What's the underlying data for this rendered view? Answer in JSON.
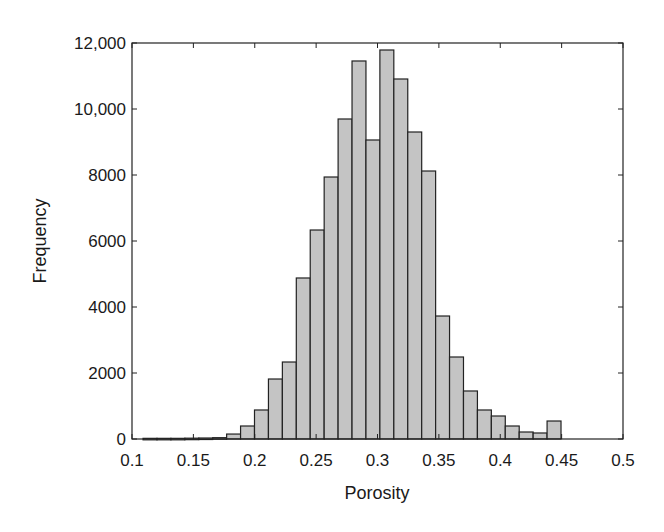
{
  "chart_data": {
    "type": "bar",
    "subtype": "histogram",
    "title": "",
    "xlabel": "Porosity",
    "ylabel": "Frequency",
    "xlim": [
      0.1,
      0.5
    ],
    "ylim": [
      0,
      12000
    ],
    "xticks": [
      0.1,
      0.15,
      0.2,
      0.25,
      0.3,
      0.35,
      0.4,
      0.45,
      0.5
    ],
    "xtick_labels": [
      "0.1",
      "0.15",
      "0.2",
      "0.25",
      "0.3",
      "0.35",
      "0.4",
      "0.45",
      "0.5"
    ],
    "yticks": [
      0,
      2000,
      4000,
      6000,
      8000,
      10000,
      12000
    ],
    "ytick_labels": [
      "0",
      "2000",
      "4000",
      "6000",
      "8000",
      "10,000",
      "12,000"
    ],
    "grid": false,
    "legend": null,
    "bin_start": 0.109,
    "bin_width": 0.01135,
    "values": [
      20,
      20,
      20,
      25,
      30,
      40,
      150,
      394,
      879,
      1818,
      2333,
      4879,
      6333,
      7939,
      9697,
      11455,
      9061,
      11788,
      10909,
      9303,
      8121,
      3727,
      2485,
      1455,
      879,
      697,
      394,
      212,
      182,
      545
    ],
    "colors": {
      "bar_fill": "#c4c4c4",
      "bar_edge": "#222222",
      "axis": "#222222"
    }
  }
}
